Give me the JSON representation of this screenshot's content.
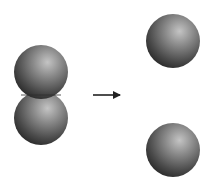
{
  "diagram": {
    "colors": {
      "background": "#ffffff",
      "sphere_highlight": "#b8b8b8",
      "sphere_mid": "#6e6e6e",
      "sphere_shadow": "#2a2a2a",
      "arrow": "#222222"
    },
    "before": {
      "label": "",
      "spheres": [
        {
          "cx": 41,
          "cy": 72,
          "r": 27
        },
        {
          "cx": 41,
          "cy": 118,
          "r": 27
        }
      ]
    },
    "arrow": {
      "x1": 93,
      "y1": 95,
      "x2": 121,
      "y2": 95,
      "direction": "right"
    },
    "after": {
      "label": "",
      "spheres": [
        {
          "cx": 173,
          "cy": 41,
          "r": 27
        },
        {
          "cx": 173,
          "cy": 150,
          "r": 27
        }
      ]
    }
  }
}
